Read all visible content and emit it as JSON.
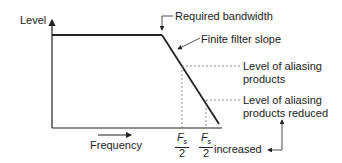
{
  "diagram": {
    "axes": {
      "y_label": "Level",
      "x_label": "Frequency"
    },
    "annotations": {
      "required_bandwidth": "Required bandwidth",
      "finite_filter_slope": "Finite filter slope",
      "aliasing_line1": "Level of aliasing",
      "aliasing_line2": "products",
      "aliasing_reduced_line1": "Level of aliasing",
      "aliasing_reduced_line2": "products reduced",
      "increased": "increased"
    },
    "ticks": [
      {
        "numerator": "F",
        "subscript": "s",
        "denominator": "2"
      },
      {
        "numerator": "F",
        "subscript": "s",
        "denominator": "2"
      }
    ],
    "colors": {
      "line": "#222222",
      "dashed": "#777777"
    }
  }
}
